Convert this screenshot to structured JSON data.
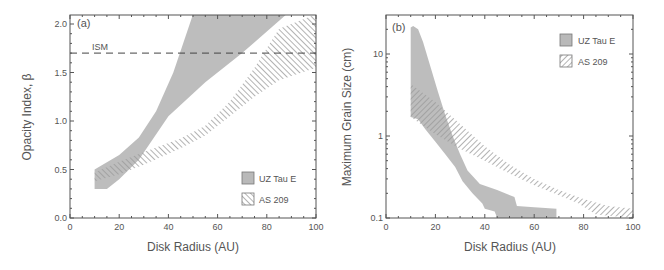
{
  "chart_data": [
    {
      "panel_label": "(a)",
      "type": "area",
      "title": "",
      "xlabel": "Disk Radius (AU)",
      "ylabel": "Opacity Index, β",
      "xlim": [
        0,
        100
      ],
      "ylim": [
        0,
        2.1
      ],
      "yscale": "linear",
      "xticks": [
        0,
        20,
        40,
        60,
        80,
        100
      ],
      "yticks": [
        0.0,
        0.5,
        1.0,
        1.5,
        2.0
      ],
      "ytick_labels": [
        "0.0",
        "0.5",
        "1.0",
        "1.5",
        "2.0"
      ],
      "grid": false,
      "legend_position": "lower right",
      "reference_line": {
        "label": "ISM",
        "y": 1.7,
        "style": "dashed"
      },
      "series": [
        {
          "name": "UZ Tau E",
          "fill": "solid-gray",
          "upper": {
            "x": [
              10,
              20,
              28,
              35,
              42,
              50,
              70,
              90,
              100
            ],
            "y": [
              0.5,
              0.65,
              0.83,
              1.1,
              1.5,
              2.1,
              2.1,
              2.1,
              2.1
            ]
          },
          "lower": {
            "x": [
              10,
              15,
              20,
              28,
              40,
              55,
              70,
              88,
              100
            ],
            "y": [
              0.3,
              0.3,
              0.4,
              0.6,
              1.05,
              1.4,
              1.7,
              2.1,
              2.1
            ]
          }
        },
        {
          "name": "AS 209",
          "fill": "hatched",
          "upper": {
            "x": [
              10,
              20,
              30,
              45,
              55,
              65,
              75,
              85,
              100
            ],
            "y": [
              0.47,
              0.58,
              0.68,
              0.82,
              0.95,
              1.2,
              1.55,
              1.95,
              2.1
            ]
          },
          "lower": {
            "x": [
              10,
              20,
              30,
              45,
              55,
              65,
              75,
              85,
              100
            ],
            "y": [
              0.38,
              0.45,
              0.55,
              0.72,
              0.85,
              1.05,
              1.25,
              1.42,
              1.55
            ]
          }
        }
      ]
    },
    {
      "panel_label": "(b)",
      "type": "area",
      "title": "",
      "xlabel": "Disk Radius (AU)",
      "ylabel": "Maximum Grain Size (cm)",
      "xlim": [
        0,
        100
      ],
      "ylim": [
        0.1,
        25
      ],
      "yscale": "log",
      "xticks": [
        0,
        20,
        40,
        60,
        80,
        100
      ],
      "yticks": [
        0.1,
        1,
        10
      ],
      "ytick_labels": [
        "0.1",
        "1",
        "10"
      ],
      "grid": false,
      "legend_position": "upper right",
      "series": [
        {
          "name": "UZ Tau E",
          "fill": "solid-gray",
          "upper": {
            "x": [
              10,
              11,
              13,
              15,
              18,
              21,
              24,
              27,
              30,
              33,
              38,
              45,
              52,
              53,
              60,
              69
            ],
            "y": [
              21,
              22,
              20,
              14,
              7,
              3.5,
              1.8,
              1.0,
              0.6,
              0.38,
              0.26,
              0.22,
              0.18,
              0.14,
              0.135,
              0.13
            ]
          },
          "lower": {
            "x": [
              10,
              13,
              16,
              20,
              24,
              28,
              31,
              35,
              39,
              40,
              44,
              45,
              69
            ],
            "y": [
              1.7,
              1.6,
              1.2,
              0.85,
              0.6,
              0.42,
              0.28,
              0.2,
              0.15,
              0.13,
              0.12,
              0.1,
              0.1
            ]
          }
        },
        {
          "name": "AS 209",
          "fill": "hatched",
          "upper": {
            "x": [
              10,
              20,
              30,
              40,
              50,
              60,
              70,
              80,
              90,
              100
            ],
            "y": [
              4.3,
              2.6,
              1.4,
              0.75,
              0.45,
              0.3,
              0.22,
              0.17,
              0.14,
              0.13
            ]
          },
          "lower": {
            "x": [
              10,
              20,
              30,
              40,
              50,
              60,
              70,
              78,
              85,
              100
            ],
            "y": [
              1.7,
              1.05,
              0.7,
              0.5,
              0.35,
              0.25,
              0.19,
              0.15,
              0.11,
              0.1
            ]
          }
        }
      ]
    }
  ],
  "panels": {
    "a": {
      "label": "(a)",
      "ism_label": "ISM",
      "xlabel": "Disk Radius (AU)",
      "ylabel": "Opacity Index, β",
      "legend": [
        "UZ Tau E",
        "AS 209"
      ]
    },
    "b": {
      "label": "(b)",
      "xlabel": "Disk Radius (AU)",
      "ylabel": "Maximum Grain Size (cm)",
      "legend": [
        "UZ Tau E",
        "AS 209"
      ]
    }
  },
  "colors": {
    "solid_fill": "#b9b9b9",
    "hatch": "#9a9a9a",
    "axis": "#555555",
    "text": "#555555"
  }
}
